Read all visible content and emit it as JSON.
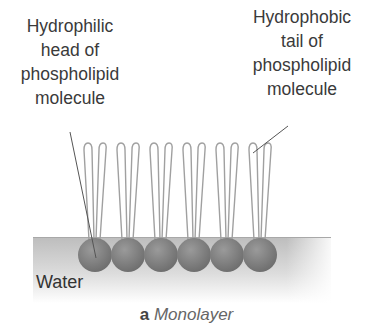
{
  "labels": {
    "head": [
      "Hydrophilic",
      "head of",
      "phospholipid",
      "molecule"
    ],
    "tail": [
      "Hydrophobic",
      "tail of",
      "phospholipid",
      "molecule"
    ],
    "water": "Water"
  },
  "caption": {
    "letter": "a",
    "title": "Monolayer"
  },
  "diagram": {
    "molecule_count": 6,
    "head_color": "#7a7a7a",
    "water_color": "#c8c8c8",
    "tail_stroke": "#9a9a9a"
  }
}
